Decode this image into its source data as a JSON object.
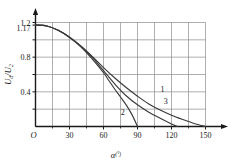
{
  "chart_data": {
    "type": "line",
    "title": "",
    "xlabel": "α(°)",
    "ylabel": "Uₐ/U₂",
    "ylabel_main": "U",
    "ylabel_sub1": "d",
    "ylabel_mid": "/U",
    "ylabel_sub2": "2",
    "xlabel_main": "α",
    "xlabel_sup": "(°)",
    "origin_label": "O",
    "xlim": [
      0,
      165
    ],
    "ylim": [
      0,
      1.2
    ],
    "grid": true,
    "grid_x_step": 15,
    "grid_y_step": 0.2,
    "legend_position": "inline-curve-labels",
    "xticks": [
      0,
      30,
      60,
      90,
      120,
      150
    ],
    "xtick_labels": [
      "O",
      "30",
      "60",
      "90",
      "120",
      "150"
    ],
    "yticks": [
      0.4,
      0.8,
      1.17,
      1.2
    ],
    "ytick_labels": [
      "0.4",
      "0.8",
      "1.17",
      "1.2"
    ],
    "series": [
      {
        "name": "1",
        "label": "1",
        "x": [
          0,
          10,
          20,
          30,
          40,
          50,
          60,
          70,
          80,
          90,
          100,
          110,
          120,
          130,
          140,
          150
        ],
        "values": [
          1.17,
          1.16,
          1.11,
          1.03,
          0.93,
          0.81,
          0.68,
          0.56,
          0.45,
          0.35,
          0.26,
          0.19,
          0.13,
          0.08,
          0.035,
          0.0
        ]
      },
      {
        "name": "2",
        "label": "2",
        "x": [
          0,
          10,
          20,
          30,
          40,
          50,
          60,
          65,
          70,
          75,
          80,
          85,
          90
        ],
        "values": [
          1.17,
          1.16,
          1.11,
          1.03,
          0.92,
          0.78,
          0.62,
          0.525,
          0.43,
          0.34,
          0.25,
          0.14,
          0.0
        ]
      },
      {
        "name": "3",
        "label": "3",
        "x": [
          0,
          10,
          20,
          30,
          40,
          50,
          60,
          70,
          80,
          90,
          100,
          110,
          120,
          125
        ],
        "values": [
          1.17,
          1.16,
          1.11,
          1.03,
          0.925,
          0.8,
          0.645,
          0.49,
          0.355,
          0.25,
          0.165,
          0.095,
          0.03,
          0.0
        ]
      }
    ],
    "curve_label_points": [
      {
        "name": "1",
        "x": 112,
        "y": 0.4
      },
      {
        "name": "2",
        "x": 77,
        "y": 0.13
      },
      {
        "name": "3",
        "x": 115,
        "y": 0.255
      }
    ],
    "colors": {
      "axis": "#1a1a1a",
      "grid": "#8c8c8c",
      "curve": "#3a3a3a",
      "text": "#1a1a1a",
      "background": "#ffffff"
    }
  }
}
